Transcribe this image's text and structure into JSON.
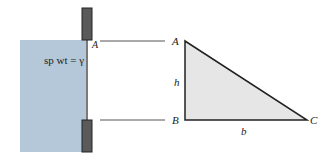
{
  "figure": {
    "tank": {
      "fluid_label": "sp wt = γ",
      "point_label": "A",
      "fluid_color": "#b5c8da",
      "gate_color": "#5a5a5a"
    },
    "triangle": {
      "vertices": {
        "A": "A",
        "B": "B",
        "C": "C"
      },
      "height_label": "h",
      "base_label": "b",
      "fill_color": "#e6e6e6",
      "stroke_color": "#222222"
    }
  }
}
